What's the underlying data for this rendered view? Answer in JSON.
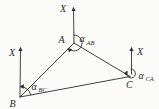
{
  "colors": {
    "line": "#2f2f2f",
    "text": "#2b2b2b",
    "background": "#fbfbfa"
  },
  "diagram": {
    "axis_label": "X",
    "vertices": {
      "a": "A",
      "b": "B",
      "c": "C"
    },
    "angles": {
      "ab": {
        "symbol": "α",
        "subscript": "AB"
      },
      "bc": {
        "symbol": "α",
        "subscript": "BC"
      },
      "ca": {
        "symbol": "α",
        "subscript": "CA"
      }
    }
  }
}
